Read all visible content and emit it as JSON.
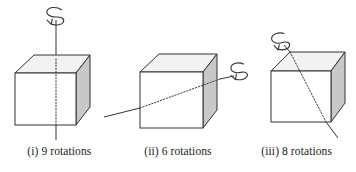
{
  "figure": {
    "kind": "geometry-diagram",
    "background_color": "#ffffff",
    "stroke_color": "#333333",
    "shaded_face_color": "#c8c8c8",
    "shaded_face_top_color": "#f2f2f2"
  },
  "panels": [
    {
      "id": "panel-i",
      "caption": "(i) 9 rotations",
      "label": "(i)",
      "count": 9,
      "axis_type": "face-to-face vertical axis",
      "rotation_arrow": "spiral-arrow-icon"
    },
    {
      "id": "panel-ii",
      "caption": "(ii) 6 rotations",
      "label": "(ii)",
      "count": 6,
      "axis_type": "face-to-face horizontal axis",
      "rotation_arrow": "spiral-arrow-icon"
    },
    {
      "id": "panel-iii",
      "caption": "(iii) 8 rotations",
      "label": "(iii)",
      "count": 8,
      "axis_type": "vertex-to-vertex diagonal axis",
      "rotation_arrow": "spiral-arrow-icon"
    }
  ]
}
